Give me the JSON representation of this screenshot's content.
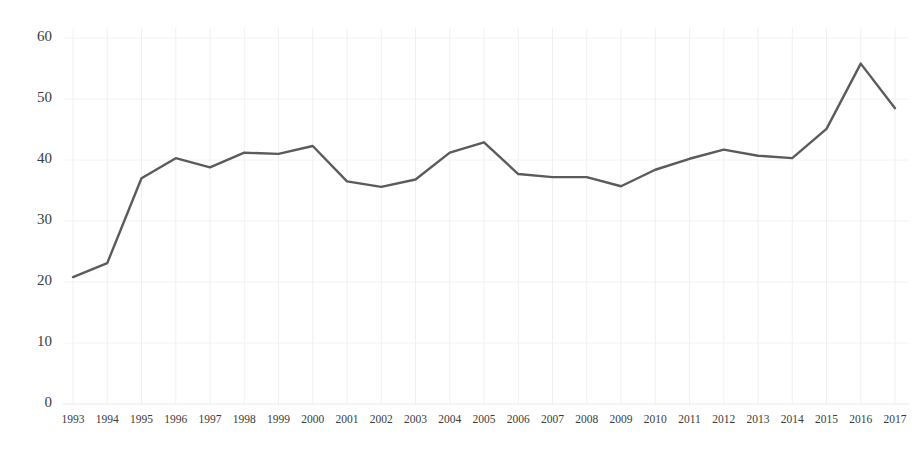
{
  "chart_data": {
    "type": "line",
    "title": "",
    "subtitle": "",
    "xlabel": "",
    "ylabel": "",
    "categories": [
      "1993",
      "1994",
      "1995",
      "1996",
      "1997",
      "1998",
      "1999",
      "2000",
      "2001",
      "2002",
      "2003",
      "2004",
      "2005",
      "2006",
      "2007",
      "2008",
      "2009",
      "2010",
      "2011",
      "2012",
      "2013",
      "2014",
      "2015",
      "2016",
      "2017"
    ],
    "values": [
      20.8,
      23.1,
      37.0,
      40.3,
      38.8,
      41.2,
      41.0,
      42.3,
      36.5,
      35.6,
      36.8,
      41.2,
      42.9,
      37.7,
      37.2,
      37.2,
      35.7,
      38.4,
      40.2,
      41.7,
      40.7,
      40.3,
      45.1,
      55.8,
      48.5
    ],
    "series": [
      {
        "name": "series-1",
        "values": [
          20.8,
          23.1,
          37.0,
          40.3,
          38.8,
          41.2,
          41.0,
          42.3,
          36.5,
          35.6,
          36.8,
          41.2,
          42.9,
          37.7,
          37.2,
          37.2,
          35.7,
          38.4,
          40.2,
          41.7,
          40.7,
          40.3,
          45.1,
          55.8,
          48.5
        ],
        "color": "#5b5b5b"
      }
    ],
    "ylim": [
      0,
      60
    ],
    "yticks": [
      0,
      10,
      20,
      30,
      40,
      50,
      60
    ],
    "ytick_labels": [
      "0",
      "10",
      "20",
      "30",
      "40",
      "50",
      "60"
    ],
    "xticks": [
      "1993",
      "1994",
      "1995",
      "1996",
      "1997",
      "1998",
      "1999",
      "2000",
      "2001",
      "2002",
      "2003",
      "2004",
      "2005",
      "2006",
      "2007",
      "2008",
      "2009",
      "2010",
      "2011",
      "2012",
      "2013",
      "2014",
      "2015",
      "2016",
      "2017"
    ],
    "grid": {
      "vertical": true,
      "horizontal": true,
      "vertical_color": "#f0f0f2",
      "horizontal_color": "#f2f2f4"
    },
    "legend": {
      "visible": false,
      "position": "none",
      "entries": []
    },
    "annotations": [],
    "background_color": "#ffffff",
    "line_color": "#5b5b5b",
    "text_color": "#3b3b3b"
  }
}
